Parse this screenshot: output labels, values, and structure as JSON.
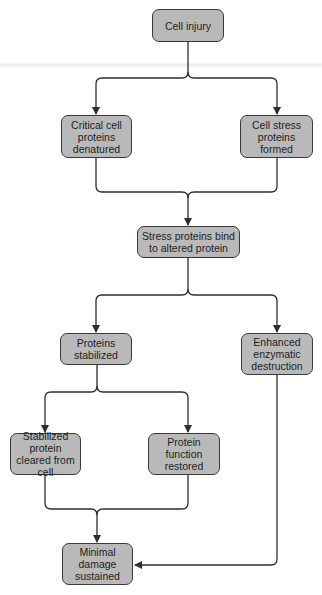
{
  "diagram": {
    "type": "flowchart",
    "colors": {
      "node_fill": "#b9b9b9",
      "node_border": "#3a3a3a",
      "line": "#2e2e2e",
      "background": "#ffffff"
    },
    "nodes": {
      "cell_injury": {
        "label": "Cell injury"
      },
      "critical_denatured": {
        "label": "Critical cell proteins denatured"
      },
      "stress_formed": {
        "label": "Cell stress proteins formed"
      },
      "stress_bind": {
        "label": "Stress proteins bind to altered protein"
      },
      "proteins_stabilized": {
        "label": "Proteins stabilized"
      },
      "enzymatic_destruction": {
        "label": "Enhanced enzymatic destruction"
      },
      "cleared": {
        "label": "Stabilized protein cleared from cell"
      },
      "function_restored": {
        "label": "Protein function restored"
      },
      "minimal_damage": {
        "label": "Minimal damage sustained"
      }
    },
    "edges": [
      {
        "from": "Cell injury",
        "to": "Critical cell proteins denatured"
      },
      {
        "from": "Cell injury",
        "to": "Cell stress proteins formed"
      },
      {
        "from": "Critical cell proteins denatured",
        "to": "Stress proteins bind to altered protein"
      },
      {
        "from": "Cell stress proteins formed",
        "to": "Stress proteins bind to altered protein"
      },
      {
        "from": "Stress proteins bind to altered protein",
        "to": "Proteins stabilized"
      },
      {
        "from": "Stress proteins bind to altered protein",
        "to": "Enhanced enzymatic destruction"
      },
      {
        "from": "Proteins stabilized",
        "to": "Stabilized protein cleared from cell"
      },
      {
        "from": "Proteins stabilized",
        "to": "Protein function restored"
      },
      {
        "from": "Stabilized protein cleared from cell",
        "to": "Minimal damage sustained"
      },
      {
        "from": "Protein function restored",
        "to": "Minimal damage sustained"
      },
      {
        "from": "Enhanced enzymatic destruction",
        "to": "Minimal damage sustained"
      }
    ]
  }
}
